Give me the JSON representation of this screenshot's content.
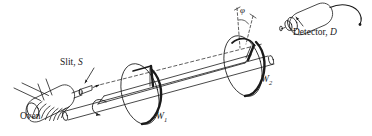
{
  "figure": {
    "background_color": "#ffffff",
    "ink_color": "#1a1a1a",
    "width": 372,
    "height": 136
  },
  "labels": {
    "oven": {
      "text": "Oven",
      "style": "upright"
    },
    "slit": {
      "prefix": "Slit,",
      "symbol": "S",
      "full": "Slit, S"
    },
    "wheel_one": {
      "symbol": "W",
      "subscript": "1",
      "full": "W1"
    },
    "wheel_two": {
      "symbol": "W",
      "subscript": "2",
      "full": "W2"
    },
    "detector": {
      "prefix": "Detector,",
      "symbol": "D",
      "full": "Detector, D"
    },
    "angle": {
      "symbol": "φ",
      "name": "phi"
    }
  },
  "components": [
    {
      "name": "oven",
      "description": "coiled cylindrical oven with two wire leads"
    },
    {
      "name": "slit",
      "description": "conical collimating nozzle emitting beam"
    },
    {
      "name": "shaft",
      "description": "long horizontal rotating rod carrying both disks"
    },
    {
      "name": "wheel-1",
      "description": "slotted rotating disk W1 with radial slot"
    },
    {
      "name": "wheel-2",
      "description": "slotted rotating disk W2 with radial slot offset by angle phi"
    },
    {
      "name": "detector",
      "description": "cylindrical detector with cable"
    },
    {
      "name": "beam-path",
      "description": "dashed molecular beam axis from slit through both disks"
    },
    {
      "name": "rotation-arrow",
      "description": "curved arrow indicating shaft rotation"
    }
  ]
}
